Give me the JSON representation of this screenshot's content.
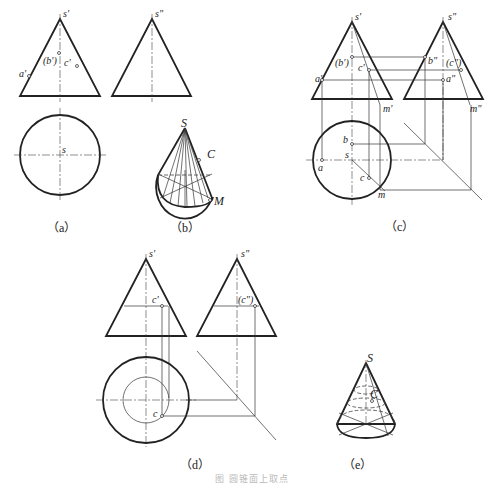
{
  "figure": {
    "caption": "图 圆锥面上取点",
    "panels": [
      {
        "id": "a",
        "label": "（a）",
        "labels": {
          "s1": "s'",
          "s2": "s\"",
          "a1": "a'",
          "b1": "(b')",
          "c1": "c'",
          "s": "s"
        }
      },
      {
        "id": "b",
        "label": "（b）",
        "labels": {
          "S": "S",
          "C": "C",
          "M": "M"
        }
      },
      {
        "id": "c",
        "label": "（c）",
        "labels": {
          "s1": "s'",
          "s2": "s\"",
          "b1": "(b')",
          "c1": "c'",
          "a1": "a'",
          "m1": "m'",
          "b2": "b\"",
          "c2": "(c\")",
          "a2": "a\"",
          "m2": "m\"",
          "b": "b",
          "s": "s",
          "a": "a",
          "c": "c",
          "m": "m"
        }
      },
      {
        "id": "d",
        "label": "（d）",
        "labels": {
          "s1": "s'",
          "s2": "s\"",
          "c1": "c'",
          "c2": "(c\")",
          "c": "c"
        }
      },
      {
        "id": "e",
        "label": "（e）",
        "labels": {
          "S": "S",
          "C": "C"
        }
      }
    ]
  }
}
